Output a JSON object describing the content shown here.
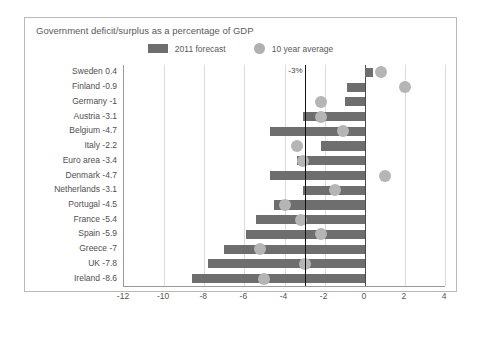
{
  "chart_data": {
    "type": "bar",
    "orientation": "horizontal",
    "title": "Government deficit/surplus as a percentage of GDP",
    "xlabel": "",
    "ylabel": "",
    "xlim": [
      -12,
      4
    ],
    "xticks": [
      -12,
      -10,
      -8,
      -6,
      -4,
      -2,
      0,
      2,
      4
    ],
    "grid": true,
    "legend_position": "top-center",
    "annotations": [
      {
        "label": "-3%",
        "x": -3,
        "type": "vertical-threshold-line"
      }
    ],
    "zero_line": 0,
    "categories": [
      "Sweden",
      "Finland",
      "Germany",
      "Austria",
      "Belgium",
      "Italy",
      "Euro area",
      "Denmark",
      "Netherlands",
      "Portugal",
      "France",
      "Spain",
      "Greece",
      "UK",
      "Ireland"
    ],
    "category_labels": [
      "Sweden 0.4",
      "Finland -0.9",
      "Germany -1",
      "Austria -3.1",
      "Belgium -4.7",
      "Italy -2.2",
      "Euro area -3.4",
      "Denmark -4.7",
      "Netherlands -3.1",
      "Portugal -4.5",
      "France -5.4",
      "Spain -5.9",
      "Greece -7",
      "UK -7.8",
      "Ireland -8.6"
    ],
    "series": [
      {
        "name": "2011 forecast",
        "color": "#6e6e6e",
        "marker": "bar",
        "values": [
          0.4,
          -0.9,
          -1,
          -3.1,
          -4.7,
          -2.2,
          -3.4,
          -4.7,
          -3.1,
          -4.5,
          -5.4,
          -5.9,
          -7,
          -7.8,
          -8.6
        ]
      },
      {
        "name": "10 year average",
        "color": "#b5b5b5",
        "marker": "circle",
        "values": [
          0.8,
          2.0,
          -2.2,
          -2.2,
          -1.1,
          -3.4,
          -3.1,
          1.0,
          -1.5,
          -4.0,
          -3.2,
          -2.2,
          -5.2,
          -3.0,
          -5.0
        ]
      }
    ]
  },
  "legend": {
    "entries": [
      {
        "label": "2011 forecast"
      },
      {
        "label": "10 year average"
      }
    ]
  }
}
